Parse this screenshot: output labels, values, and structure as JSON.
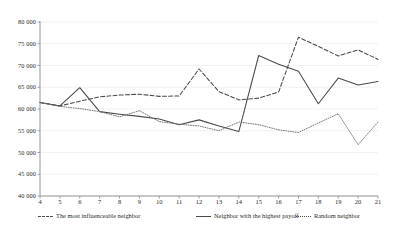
{
  "chart_data": {
    "type": "line",
    "title": "",
    "xlabel": "",
    "ylabel": "",
    "xlim": [
      4,
      21
    ],
    "ylim": [
      40000,
      80000
    ],
    "grid": true,
    "legend_position": "bottom",
    "x": [
      4,
      5,
      6,
      7,
      8,
      9,
      10,
      11,
      12,
      13,
      14,
      15,
      16,
      17,
      18,
      19,
      20,
      21
    ],
    "x_ticks": [
      "4",
      "5",
      "6",
      "7",
      "8",
      "9",
      "10",
      "11",
      "12",
      "13",
      "14",
      "15",
      "16",
      "17",
      "18",
      "19",
      "20",
      "21"
    ],
    "y_ticks": [
      "40 000",
      "45 000",
      "50 000",
      "55 000",
      "60 000",
      "65 000",
      "70 000",
      "75 000",
      "80 000"
    ],
    "y_tick_values": [
      40000,
      45000,
      50000,
      55000,
      60000,
      65000,
      70000,
      75000,
      80000
    ],
    "series": [
      {
        "name": "The most influenceable neighbor",
        "style": "dashed",
        "color": "#4a4a4a",
        "values": [
          61500,
          60700,
          61800,
          62800,
          63200,
          63400,
          62900,
          63000,
          69200,
          64000,
          62100,
          62500,
          63900,
          76500,
          74400,
          72200,
          73600,
          71400
        ]
      },
      {
        "name": "Neighbor with the highest payoff",
        "style": "solid",
        "color": "#4a4a4a",
        "values": [
          61500,
          60700,
          64900,
          59400,
          58800,
          58300,
          57700,
          56400,
          57500,
          56100,
          54800,
          72300,
          70300,
          68700,
          61200,
          67100,
          65500,
          66300
        ]
      },
      {
        "name": "Random neighbor",
        "style": "dotted",
        "color": "#6e6e6e",
        "values": [
          61500,
          60600,
          60100,
          59400,
          58200,
          59600,
          57100,
          56500,
          56100,
          55000,
          57000,
          56400,
          55200,
          54600,
          56800,
          58900,
          51800,
          57000
        ]
      }
    ]
  },
  "legend": {
    "items": [
      {
        "label": "The most influenceable neighbor",
        "style": "dashed"
      },
      {
        "label": "Neighbor with the highest payoff",
        "style": "solid"
      },
      {
        "label": "Random neighbor",
        "style": "dotted"
      }
    ]
  }
}
